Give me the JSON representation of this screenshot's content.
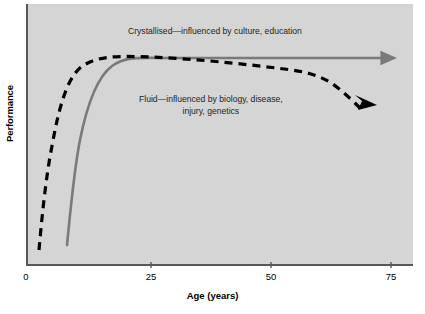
{
  "chart_data": {
    "type": "line",
    "title": "",
    "subtitle": "",
    "xlabel": "Age (years)",
    "ylabel": "Performance",
    "xlim": [
      0,
      79
    ],
    "ylim": [
      0,
      100
    ],
    "xticks": [
      0,
      25,
      50,
      75
    ],
    "xtick_labels": [
      "0",
      "25",
      "50",
      "75"
    ],
    "yticks": [],
    "ytick_labels": [],
    "grid": false,
    "legend_position": "inline-annotations",
    "background_color": "#d5d5d5",
    "axis_color": "#58585a",
    "series": [
      {
        "name": "Crystallised",
        "style": "solid",
        "color": "#7a7a7c",
        "arrow": "right",
        "annotation": "Crystallised—influenced by culture, education",
        "x": [
          8.5,
          10,
          12,
          14,
          17,
          20,
          23,
          26,
          30,
          35,
          40,
          50,
          60,
          70,
          77
        ],
        "y": [
          8,
          24,
          45,
          60,
          74,
          83,
          88,
          91,
          92,
          92,
          92,
          92,
          92,
          92,
          92
        ]
      },
      {
        "name": "Fluid",
        "style": "dashed",
        "color": "#000000",
        "arrow": "down-right",
        "annotation_line1": "Fluid—influenced by biology, disease,",
        "annotation_line2": "injury, genetics",
        "x": [
          3,
          6,
          9,
          12,
          15,
          18,
          21,
          24,
          26,
          30,
          35,
          40,
          45,
          50,
          55,
          60,
          64,
          67,
          70
        ],
        "y": [
          5,
          28,
          50,
          66,
          78,
          86,
          90,
          92,
          93,
          92,
          90,
          88,
          86,
          84,
          80,
          75,
          68,
          58,
          47
        ]
      }
    ],
    "annotations": [
      {
        "id": "crystallised-label",
        "text": "Crystallised—influenced by culture, education",
        "x": 128,
        "y": 26
      },
      {
        "id": "fluid-label",
        "line1": "Fluid—influenced by biology, disease,",
        "line2": "injury, genetics",
        "x": 139,
        "y": 94
      }
    ]
  },
  "axes": {
    "x": {
      "title": "Age (years)",
      "ticks": [
        {
          "value": "0",
          "px": 26
        },
        {
          "value": "25",
          "px": 151
        },
        {
          "value": "50",
          "px": 271
        },
        {
          "value": "75",
          "px": 391
        }
      ]
    },
    "y": {
      "title": "Performance"
    }
  },
  "labels": {
    "crystallised": "Crystallised—influenced by culture, education",
    "fluid_line1": "Fluid—influenced by biology, disease,",
    "fluid_line2": "injury, genetics"
  }
}
